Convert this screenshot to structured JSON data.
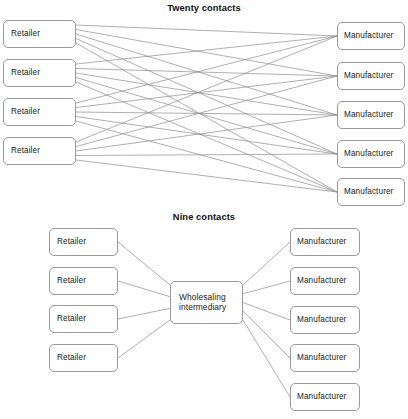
{
  "figure": {
    "background_color": "#ffffff",
    "line_color": "#8c8c8c",
    "box_border_color": "#9a9a9a",
    "text_color": "#222222"
  },
  "panels": [
    {
      "id": "twenty-contacts",
      "title": "Twenty contacts",
      "title_x": 205,
      "title_y": 3,
      "left_nodes": [
        {
          "label": "Retailer",
          "x": 3,
          "y": 20,
          "w": 73,
          "h": 28
        },
        {
          "label": "Retailer",
          "x": 3,
          "y": 59,
          "w": 73,
          "h": 28
        },
        {
          "label": "Retailer",
          "x": 3,
          "y": 98,
          "w": 73,
          "h": 28
        },
        {
          "label": "Retailer",
          "x": 3,
          "y": 137,
          "w": 73,
          "h": 28
        }
      ],
      "right_nodes": [
        {
          "label": "Manufacturer",
          "x": 337,
          "y": 22,
          "w": 68,
          "h": 28
        },
        {
          "label": "Manufacturer",
          "x": 337,
          "y": 62,
          "w": 68,
          "h": 28
        },
        {
          "label": "Manufacturer",
          "x": 337,
          "y": 101,
          "w": 68,
          "h": 28
        },
        {
          "label": "Manufacturer",
          "x": 337,
          "y": 140,
          "w": 68,
          "h": 28
        },
        {
          "label": "Manufacturer",
          "x": 337,
          "y": 178,
          "w": 68,
          "h": 28
        }
      ],
      "connections": "every-left-to-every-right",
      "contact_count": 20
    },
    {
      "id": "nine-contacts",
      "title": "Nine contacts",
      "title_x": 205,
      "title_y": 212,
      "left_nodes": [
        {
          "label": "Retailer",
          "x": 49,
          "y": 228,
          "w": 69,
          "h": 28
        },
        {
          "label": "Retailer",
          "x": 49,
          "y": 267,
          "w": 69,
          "h": 28
        },
        {
          "label": "Retailer",
          "x": 49,
          "y": 305,
          "w": 69,
          "h": 28
        },
        {
          "label": "Retailer",
          "x": 49,
          "y": 344,
          "w": 69,
          "h": 28
        }
      ],
      "hub_node": {
        "label": "Wholesaling\nintermediary",
        "x": 170,
        "y": 281,
        "w": 73,
        "h": 43
      },
      "right_nodes": [
        {
          "label": "Manufacturer",
          "x": 290,
          "y": 228,
          "w": 70,
          "h": 28
        },
        {
          "label": "Manufacturer",
          "x": 290,
          "y": 267,
          "w": 70,
          "h": 28
        },
        {
          "label": "Manufacturer",
          "x": 290,
          "y": 306,
          "w": 70,
          "h": 28
        },
        {
          "label": "Manufacturer",
          "x": 290,
          "y": 344,
          "w": 70,
          "h": 28
        },
        {
          "label": "Manufacturer",
          "x": 290,
          "y": 383,
          "w": 70,
          "h": 28
        }
      ],
      "connections": "every-left-to-hub-and-hub-to-every-right",
      "contact_count": 9
    }
  ]
}
